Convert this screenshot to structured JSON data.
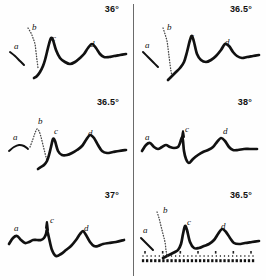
{
  "figure": {
    "name": "spectral-trace-panel-grid",
    "columns": 2,
    "rows": 3,
    "divider_color": "#6a6a6a",
    "trace_color": "#111111",
    "background": "#fefefe"
  },
  "panels": [
    {
      "id": "panel-1",
      "angle": "36°",
      "peak_labels": [
        "a",
        "b",
        "c",
        "d"
      ],
      "has_ruler": false,
      "chart_data": {
        "type": "line",
        "title": "36°",
        "xlabel": "",
        "ylabel": "",
        "xlim": [
          0,
          126
        ],
        "ylim": [
          0,
          70
        ],
        "grid": false,
        "legend": "none",
        "annotations": [
          {
            "label": "a",
            "x": 10,
            "y": 28
          },
          {
            "label": "b",
            "x": 28,
            "y": 9
          },
          {
            "label": "c",
            "x": 48,
            "y": 20
          },
          {
            "label": "d",
            "x": 86,
            "y": 26
          }
        ],
        "series": [
          {
            "name": "shoulder-a",
            "style": "solid",
            "x": [
              6,
              11,
              16,
              20
            ],
            "values": [
              38,
              42,
              47,
              51
            ]
          },
          {
            "name": "shoulder-b",
            "style": "dotted",
            "x": [
              24,
              27,
              29,
              31,
              32,
              33,
              34
            ],
            "values": [
              14,
              19,
              24,
              30,
              38,
              46,
              54
            ]
          },
          {
            "name": "main-trace",
            "style": "solid",
            "x": [
              30,
              33,
              36,
              39,
              41,
              43,
              45,
              47,
              49,
              52,
              56,
              61,
              66,
              71,
              76,
              80,
              84,
              88,
              92,
              96,
              100,
              105,
              110,
              116,
              122
            ],
            "values": [
              64,
              62,
              58,
              52,
              46,
              38,
              30,
              24,
              26,
              36,
              44,
              48,
              50,
              48,
              44,
              40,
              34,
              30,
              34,
              40,
              43,
              43,
              42,
              41,
              40
            ]
          }
        ]
      }
    },
    {
      "id": "panel-2",
      "angle": "36.5°",
      "peak_labels": [
        "a",
        "b",
        "c",
        "d"
      ],
      "has_ruler": false,
      "chart_data": {
        "type": "line",
        "title": "36.5°",
        "xlabel": "",
        "ylabel": "",
        "xlim": [
          0,
          126
        ],
        "ylim": [
          0,
          70
        ],
        "grid": false,
        "legend": "none",
        "annotations": [
          {
            "label": "a",
            "x": 8,
            "y": 27
          },
          {
            "label": "b",
            "x": 30,
            "y": 9
          },
          {
            "label": "c",
            "x": 53,
            "y": 18
          },
          {
            "label": "d",
            "x": 88,
            "y": 24
          }
        ],
        "series": [
          {
            "name": "shoulder-a",
            "style": "solid",
            "x": [
              6,
              11,
              16,
              21
            ],
            "values": [
              38,
              43,
              48,
              53
            ]
          },
          {
            "name": "shoulder-b",
            "style": "dotted",
            "x": [
              26,
              28,
              30,
              31,
              32,
              33,
              34,
              35
            ],
            "values": [
              14,
              20,
              27,
              34,
              42,
              50,
              57,
              62
            ]
          },
          {
            "name": "main-trace",
            "style": "solid",
            "x": [
              31,
              35,
              39,
              43,
              47,
              50,
              53,
              55,
              57,
              60,
              64,
              69,
              74,
              79,
              84,
              88,
              92,
              96,
              100,
              105,
              110,
              116,
              122
            ],
            "values": [
              66,
              62,
              58,
              54,
              48,
              38,
              26,
              22,
              28,
              40,
              46,
              48,
              46,
              42,
              36,
              30,
              32,
              38,
              42,
              44,
              43,
              42,
              41
            ]
          }
        ]
      }
    },
    {
      "id": "panel-3",
      "angle": "36.5°",
      "peak_labels": [
        "a",
        "b",
        "c",
        "d"
      ],
      "has_ruler": false,
      "chart_data": {
        "type": "line",
        "title": "36.5°",
        "xlabel": "",
        "ylabel": "",
        "xlim": [
          0,
          126
        ],
        "ylim": [
          0,
          70
        ],
        "grid": false,
        "legend": "none",
        "annotations": [
          {
            "label": "a",
            "x": 9,
            "y": 26
          },
          {
            "label": "b",
            "x": 34,
            "y": 10
          },
          {
            "label": "c",
            "x": 50,
            "y": 20
          },
          {
            "label": "d",
            "x": 84,
            "y": 22
          }
        ],
        "series": [
          {
            "name": "shoulder-a",
            "style": "solid",
            "x": [
              5,
              10,
              15,
              20,
              24
            ],
            "values": [
              44,
              40,
              38,
              39,
              42
            ]
          },
          {
            "name": "scatter-b",
            "style": "dotted",
            "x": [
              26,
              29,
              31,
              33,
              35,
              37,
              39,
              41,
              43
            ],
            "values": [
              40,
              32,
              26,
              22,
              24,
              30,
              38,
              46,
              54
            ]
          },
          {
            "name": "main-trace",
            "style": "solid",
            "x": [
              34,
              37,
              40,
              43,
              45,
              47,
              49,
              51,
              54,
              58,
              63,
              68,
              73,
              78,
              82,
              86,
              90,
              94,
              98,
              103,
              109,
              115,
              122
            ],
            "values": [
              62,
              60,
              58,
              54,
              48,
              40,
              32,
              34,
              44,
              48,
              48,
              46,
              43,
              39,
              33,
              28,
              31,
              38,
              44,
              46,
              45,
              44,
              43
            ]
          }
        ]
      }
    },
    {
      "id": "panel-4",
      "angle": "38°",
      "peak_labels": [
        "a",
        "c",
        "d"
      ],
      "has_ruler": false,
      "chart_data": {
        "type": "line",
        "title": "38°",
        "xlabel": "",
        "ylabel": "",
        "xlim": [
          0,
          126
        ],
        "ylim": [
          0,
          70
        ],
        "grid": false,
        "legend": "none",
        "annotations": [
          {
            "label": "a",
            "x": 8,
            "y": 26
          },
          {
            "label": "c",
            "x": 48,
            "y": 18
          },
          {
            "label": "d",
            "x": 86,
            "y": 20
          }
        ],
        "series": [
          {
            "name": "main-trace",
            "style": "solid",
            "x": [
              5,
              9,
              13,
              17,
              21,
              25,
              29,
              33,
              37,
              41,
              43,
              45,
              46,
              47,
              49,
              52,
              56,
              61,
              66,
              71,
              76,
              80,
              84,
              88,
              92,
              96,
              101,
              107,
              113,
              120
            ],
            "values": [
              44,
              38,
              36,
              40,
              42,
              40,
              38,
              40,
              41,
              40,
              36,
              30,
              34,
              44,
              52,
              56,
              52,
              48,
              45,
              43,
              40,
              35,
              31,
              34,
              40,
              43,
              43,
              42,
              42,
              42
            ]
          },
          {
            "name": "spike-c",
            "style": "solid",
            "x": [
              45,
              46,
              47
            ],
            "values": [
              30,
              24,
              30
            ]
          }
        ]
      }
    },
    {
      "id": "panel-5",
      "angle": "37°",
      "peak_labels": [
        "a",
        "c",
        "d"
      ],
      "has_ruler": false,
      "chart_data": {
        "type": "line",
        "title": "37°",
        "xlabel": "",
        "ylabel": "",
        "xlim": [
          0,
          126
        ],
        "ylim": [
          0,
          70
        ],
        "grid": false,
        "legend": "none",
        "annotations": [
          {
            "label": "a",
            "x": 10,
            "y": 24
          },
          {
            "label": "c",
            "x": 46,
            "y": 16
          },
          {
            "label": "d",
            "x": 80,
            "y": 24
          }
        ],
        "series": [
          {
            "name": "main-trace",
            "style": "solid",
            "x": [
              5,
              9,
              13,
              17,
              21,
              25,
              29,
              33,
              37,
              40,
              42,
              43,
              45,
              48,
              52,
              57,
              62,
              67,
              72,
              76,
              79,
              82,
              86,
              90,
              94,
              99,
              105,
              112,
              120
            ],
            "values": [
              44,
              38,
              36,
              40,
              43,
              42,
              40,
              40,
              40,
              38,
              34,
              30,
              38,
              50,
              56,
              54,
              50,
              46,
              40,
              34,
              31,
              35,
              42,
              46,
              46,
              44,
              43,
              42,
              40
            ]
          },
          {
            "name": "spike-c",
            "style": "solid",
            "x": [
              42,
              43,
              44
            ],
            "values": [
              28,
              22,
              30
            ]
          }
        ]
      }
    },
    {
      "id": "panel-6",
      "angle": "36.5°",
      "peak_labels": [
        "a",
        "b",
        "c",
        "d"
      ],
      "has_ruler": true,
      "ruler": {
        "name": "tick-scale",
        "major_ticks": 7,
        "minor_ticks": 28
      },
      "chart_data": {
        "type": "line",
        "title": "36.5°",
        "xlabel": "",
        "ylabel": "",
        "xlim": [
          0,
          126
        ],
        "ylim": [
          0,
          70
        ],
        "grid": false,
        "legend": "none",
        "annotations": [
          {
            "label": "a",
            "x": 6,
            "y": 26
          },
          {
            "label": "b",
            "x": 26,
            "y": 6
          },
          {
            "label": "c",
            "x": 50,
            "y": 18
          },
          {
            "label": "d",
            "x": 84,
            "y": 22
          }
        ],
        "series": [
          {
            "name": "shoulder-a",
            "style": "solid",
            "x": [
              4,
              8,
              12,
              16
            ],
            "values": [
              38,
              42,
              46,
              50
            ]
          },
          {
            "name": "shoulder-b",
            "style": "dotted",
            "x": [
              20,
              22,
              24,
              26,
              28,
              29,
              30
            ],
            "values": [
              12,
              18,
              26,
              34,
              42,
              50,
              56
            ]
          },
          {
            "name": "main-trace",
            "style": "solid",
            "x": [
              26,
              30,
              34,
              38,
              41,
              44,
              46,
              48,
              50,
              53,
              57,
              62,
              67,
              72,
              77,
              81,
              85,
              89,
              93,
              97,
              102,
              108,
              115,
              122
            ],
            "values": [
              58,
              56,
              54,
              52,
              50,
              44,
              34,
              26,
              30,
              42,
              48,
              48,
              46,
              44,
              40,
              34,
              29,
              32,
              38,
              43,
              44,
              43,
              42,
              41
            ]
          }
        ]
      }
    }
  ]
}
